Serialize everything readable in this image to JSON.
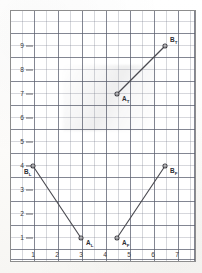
{
  "figure": {
    "title": "",
    "background_color": "#ffffff",
    "frame_color": "#8d8d8d",
    "grid_minor_color": "#787d8c",
    "grid_major_color": "#585c6c",
    "line_color": "#4a4a50",
    "marker_fill": "#ffffff"
  },
  "chart_data": {
    "type": "line",
    "title": "",
    "xlabel": "",
    "ylabel": "",
    "xlim": [
      0,
      7.6
    ],
    "ylim": [
      0,
      9.9
    ],
    "grid": true,
    "grid_minor_step": 0.5,
    "grid_major_step": 1,
    "legend_position": "none",
    "xticks": [
      1,
      2,
      3,
      4,
      5,
      6,
      7
    ],
    "xticklabels": [
      "1",
      "2",
      "3",
      "4",
      "5",
      "6",
      "7"
    ],
    "yticks": [
      1,
      2,
      3,
      4,
      5,
      6,
      7,
      8,
      9
    ],
    "yticklabels": [
      "1",
      "2",
      "3",
      "4",
      "5",
      "6",
      "7",
      "8",
      "9"
    ],
    "series": [
      {
        "name": "T",
        "points": [
          {
            "label": "A_T",
            "label_text": "A",
            "label_sub": "T",
            "x": 4.5,
            "y": 7
          },
          {
            "label": "B_T",
            "label_text": "B",
            "label_sub": "T",
            "x": 6.5,
            "y": 9
          }
        ]
      },
      {
        "name": "L",
        "points": [
          {
            "label": "B_L",
            "label_text": "B",
            "label_sub": "L",
            "x": 1,
            "y": 4
          },
          {
            "label": "A_L",
            "label_text": "A",
            "label_sub": "L",
            "x": 3,
            "y": 1
          }
        ]
      },
      {
        "name": "F",
        "points": [
          {
            "label": "A_F",
            "label_text": "A",
            "label_sub": "F",
            "x": 4.5,
            "y": 1
          },
          {
            "label": "B_F",
            "label_text": "B",
            "label_sub": "F",
            "x": 6.5,
            "y": 4
          }
        ]
      }
    ],
    "annotations": [
      {
        "name": "label-A-T",
        "text": "A",
        "sub": "T",
        "x": 4.5,
        "y": 7,
        "dx": 5,
        "dy": 7
      },
      {
        "name": "label-B-T",
        "text": "B",
        "sub": "T",
        "x": 6.5,
        "y": 9,
        "dx": 5,
        "dy": -4
      },
      {
        "name": "label-B-L",
        "text": "B",
        "sub": "L",
        "x": 1,
        "y": 4,
        "dx": -9,
        "dy": 8
      },
      {
        "name": "label-A-L",
        "text": "A",
        "sub": "L",
        "x": 3,
        "y": 1,
        "dx": 5,
        "dy": 7
      },
      {
        "name": "label-A-F",
        "text": "A",
        "sub": "F",
        "x": 4.5,
        "y": 1,
        "dx": 5,
        "dy": 7
      },
      {
        "name": "label-B-F",
        "text": "B",
        "sub": "F",
        "x": 6.5,
        "y": 4,
        "dx": 5,
        "dy": 7
      }
    ]
  }
}
